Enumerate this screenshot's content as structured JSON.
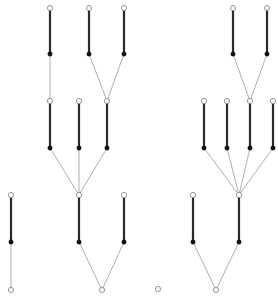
{
  "diagram": {
    "title": "",
    "type": "rooted-tree-forest",
    "colors": {
      "background": "#ffffff",
      "thick_edge": "#2a2a2a",
      "thin_edge": "#9a9a9a",
      "open_node_stroke": "#8a8a8a",
      "filled_node": "#111111"
    },
    "nodes": [
      {
        "id": "a1",
        "x": 50,
        "y": 8,
        "type": "open"
      },
      {
        "id": "a2",
        "x": 89,
        "y": 8,
        "type": "open"
      },
      {
        "id": "a3",
        "x": 124,
        "y": 8,
        "type": "open"
      },
      {
        "id": "b1",
        "x": 50,
        "y": 54,
        "type": "filled"
      },
      {
        "id": "b2",
        "x": 89,
        "y": 54,
        "type": "filled"
      },
      {
        "id": "b3",
        "x": 124,
        "y": 54,
        "type": "filled"
      },
      {
        "id": "c1",
        "x": 50,
        "y": 101,
        "type": "open"
      },
      {
        "id": "c2",
        "x": 79,
        "y": 101,
        "type": "open"
      },
      {
        "id": "c3",
        "x": 107,
        "y": 101,
        "type": "open"
      },
      {
        "id": "d1",
        "x": 50,
        "y": 148,
        "type": "filled"
      },
      {
        "id": "d2",
        "x": 79,
        "y": 148,
        "type": "filled"
      },
      {
        "id": "d3",
        "x": 107,
        "y": 148,
        "type": "filled"
      },
      {
        "id": "e1",
        "x": 11,
        "y": 195,
        "type": "open"
      },
      {
        "id": "e2",
        "x": 79,
        "y": 195,
        "type": "open"
      },
      {
        "id": "e3",
        "x": 124,
        "y": 195,
        "type": "open"
      },
      {
        "id": "f1",
        "x": 11,
        "y": 242,
        "type": "filled"
      },
      {
        "id": "f2",
        "x": 79,
        "y": 242,
        "type": "filled"
      },
      {
        "id": "f3",
        "x": 124,
        "y": 242,
        "type": "filled"
      },
      {
        "id": "g1",
        "x": 11,
        "y": 290,
        "type": "open"
      },
      {
        "id": "g2",
        "x": 102,
        "y": 290,
        "type": "open"
      },
      {
        "id": "ra1",
        "x": 233,
        "y": 8,
        "type": "open"
      },
      {
        "id": "ra2",
        "x": 267,
        "y": 8,
        "type": "open"
      },
      {
        "id": "rb1",
        "x": 233,
        "y": 54,
        "type": "filled"
      },
      {
        "id": "rb2",
        "x": 267,
        "y": 54,
        "type": "filled"
      },
      {
        "id": "rc1",
        "x": 204,
        "y": 101,
        "type": "open"
      },
      {
        "id": "rc2",
        "x": 227,
        "y": 101,
        "type": "open"
      },
      {
        "id": "rc3",
        "x": 250,
        "y": 101,
        "type": "open"
      },
      {
        "id": "rc4",
        "x": 273,
        "y": 101,
        "type": "open"
      },
      {
        "id": "rd1",
        "x": 204,
        "y": 148,
        "type": "filled"
      },
      {
        "id": "rd2",
        "x": 227,
        "y": 148,
        "type": "filled"
      },
      {
        "id": "rd3",
        "x": 250,
        "y": 148,
        "type": "filled"
      },
      {
        "id": "rd4",
        "x": 273,
        "y": 148,
        "type": "filled"
      },
      {
        "id": "re1",
        "x": 193,
        "y": 195,
        "type": "open"
      },
      {
        "id": "re2",
        "x": 239,
        "y": 195,
        "type": "open"
      },
      {
        "id": "rf1",
        "x": 193,
        "y": 242,
        "type": "filled"
      },
      {
        "id": "rf2",
        "x": 239,
        "y": 242,
        "type": "filled"
      },
      {
        "id": "rg1",
        "x": 216,
        "y": 290,
        "type": "open"
      },
      {
        "id": "iso",
        "x": 158,
        "y": 289,
        "type": "open"
      }
    ],
    "edges": [
      {
        "from": "a1",
        "to": "b1",
        "style": "thick"
      },
      {
        "from": "a2",
        "to": "b2",
        "style": "thick"
      },
      {
        "from": "a3",
        "to": "b3",
        "style": "thick"
      },
      {
        "from": "b1",
        "to": "c1",
        "style": "thin"
      },
      {
        "from": "b2",
        "to": "c3",
        "style": "thin"
      },
      {
        "from": "b3",
        "to": "c3",
        "style": "thin"
      },
      {
        "from": "c1",
        "to": "d1",
        "style": "thick"
      },
      {
        "from": "c2",
        "to": "d2",
        "style": "thick"
      },
      {
        "from": "c3",
        "to": "d3",
        "style": "thick"
      },
      {
        "from": "d1",
        "to": "e2",
        "style": "thin"
      },
      {
        "from": "d2",
        "to": "e2",
        "style": "thin"
      },
      {
        "from": "d3",
        "to": "e2",
        "style": "thin"
      },
      {
        "from": "e1",
        "to": "f1",
        "style": "thick"
      },
      {
        "from": "e2",
        "to": "f2",
        "style": "thick"
      },
      {
        "from": "e3",
        "to": "f3",
        "style": "thick"
      },
      {
        "from": "f1",
        "to": "g1",
        "style": "thin"
      },
      {
        "from": "f2",
        "to": "g2",
        "style": "thin"
      },
      {
        "from": "f3",
        "to": "g2",
        "style": "thin"
      },
      {
        "from": "ra1",
        "to": "rb1",
        "style": "thick"
      },
      {
        "from": "ra2",
        "to": "rb2",
        "style": "thick"
      },
      {
        "from": "rb1",
        "to": "rc3",
        "style": "thin"
      },
      {
        "from": "rb2",
        "to": "rc3",
        "style": "thin"
      },
      {
        "from": "rc1",
        "to": "rd1",
        "style": "thick"
      },
      {
        "from": "rc2",
        "to": "rd2",
        "style": "thick"
      },
      {
        "from": "rc3",
        "to": "rd3",
        "style": "thick"
      },
      {
        "from": "rc4",
        "to": "rd4",
        "style": "thick"
      },
      {
        "from": "rd1",
        "to": "re2",
        "style": "thin"
      },
      {
        "from": "rd2",
        "to": "re2",
        "style": "thin"
      },
      {
        "from": "rd3",
        "to": "re2",
        "style": "thin"
      },
      {
        "from": "rd4",
        "to": "re2",
        "style": "thin"
      },
      {
        "from": "re1",
        "to": "rf1",
        "style": "thick"
      },
      {
        "from": "re2",
        "to": "rf2",
        "style": "thick"
      },
      {
        "from": "rf1",
        "to": "rg1",
        "style": "thin"
      },
      {
        "from": "rf2",
        "to": "rg1",
        "style": "thin"
      }
    ]
  }
}
